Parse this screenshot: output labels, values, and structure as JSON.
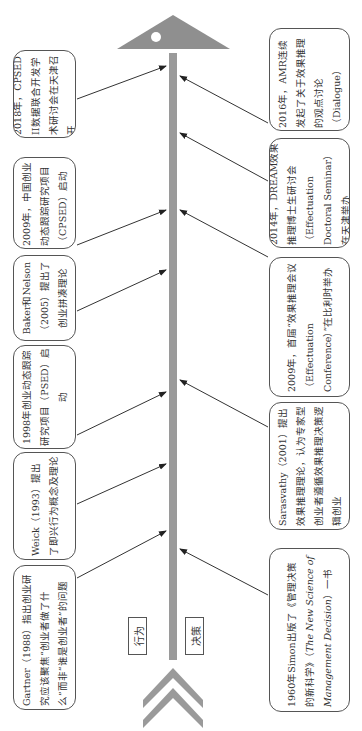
{
  "diagram": {
    "orientation": "rotated-90-ccw",
    "spine_color": "#9a9a9a",
    "arrowhead_color": "#8f8f8f",
    "chevron_color": "#9a9a9a",
    "axis_labels": {
      "left": "行为",
      "right": "决策"
    },
    "left_branch": [
      {
        "id": "gartner",
        "text": "Gartner（1988）指出创业研究应该聚焦“创业者做了什么”而非“谁是创业者”的问题"
      },
      {
        "id": "weick",
        "text": "Weick（1993）提出了即兴行为概念及理论"
      },
      {
        "id": "psed",
        "text": "1998年创业动态跟踪研究项目（PSED）启动"
      },
      {
        "id": "baker",
        "text": "Baker和Nelson（2005）提出了创业拼凑理论"
      },
      {
        "id": "cpsed",
        "text": "2009年，中国创业动态跟踪研究项目（CPSED）启动"
      },
      {
        "id": "cpsed2",
        "text": "2018年，CPSED II数据联合开发学术研讨会在天津召开"
      }
    ],
    "right_branch": [
      {
        "id": "simon",
        "text_parts": [
          "1960年Simon出版了《管理决策的新科学》（",
          "The New Science of Management Decision",
          "）一书"
        ]
      },
      {
        "id": "sarasvathy",
        "text": "Sarasvathy（2001）提出效果推理理论，认为专家型创业者遵循效果推理决策逻辑创业"
      },
      {
        "id": "effectuation_conf",
        "text": "2009年，首届“效果推理会议（Effectuation Conference）”在比利时举办"
      },
      {
        "id": "dream",
        "text": "2014年，DREAM效果推理博士生研讨会（Effectuation Doctoral Seminar）在天津举办"
      },
      {
        "id": "amr",
        "text": "2016年，AMR连续发起了关于效果推理的观点讨论（Dialogue）"
      }
    ]
  }
}
